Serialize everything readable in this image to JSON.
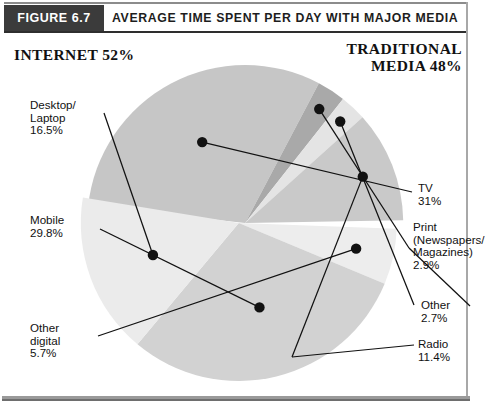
{
  "figure": {
    "tab_label": "FIGURE 6.7",
    "title": "AVERAGE TIME SPENT PER DAY WITH MAJOR MEDIA"
  },
  "sections": {
    "internet": "INTERNET 52%",
    "traditional_line1": "TRADITIONAL",
    "traditional_line2": "MEDIA 48%"
  },
  "labels": {
    "desktop": "Desktop/\nLaptop\n16.5%",
    "mobile": "Mobile\n29.8%",
    "other_digital": "Other\ndigital\n5.7%",
    "tv": "TV\n31%",
    "print": "Print\n(Newspapers/\nMagazines)\n2.9%",
    "other": "Other\n2.7%",
    "radio": "Radio\n11.4%"
  },
  "chart_data": {
    "type": "pie",
    "title": "AVERAGE TIME SPENT PER DAY WITH MAJOR MEDIA",
    "unit": "percent",
    "groups": [
      {
        "name": "INTERNET",
        "total": 52
      },
      {
        "name": "TRADITIONAL MEDIA",
        "total": 48
      }
    ],
    "categories": [
      "TV",
      "Print (Newspapers/Magazines)",
      "Other",
      "Radio",
      "Other digital",
      "Mobile",
      "Desktop/Laptop"
    ],
    "values": [
      31,
      2.9,
      2.7,
      11.4,
      5.7,
      29.8,
      16.5
    ],
    "slices": [
      {
        "label": "TV",
        "value": 31,
        "group": "TRADITIONAL MEDIA",
        "color": "#c6c6c6"
      },
      {
        "label": "Print (Newspapers/Magazines)",
        "value": 2.9,
        "group": "TRADITIONAL MEDIA",
        "color": "#a9a9a9"
      },
      {
        "label": "Other",
        "value": 2.7,
        "group": "TRADITIONAL MEDIA",
        "color": "#e4e4e4"
      },
      {
        "label": "Radio",
        "value": 11.4,
        "group": "TRADITIONAL MEDIA",
        "color": "#c9c9c9"
      },
      {
        "label": "Other digital",
        "value": 5.7,
        "group": "INTERNET",
        "color": "#ededed"
      },
      {
        "label": "Mobile",
        "value": 29.8,
        "group": "INTERNET",
        "color": "#d2d2d2"
      },
      {
        "label": "Desktop/Laptop",
        "value": 16.5,
        "group": "INTERNET",
        "color": "#ebebeb"
      }
    ],
    "legend": "none",
    "grid": false
  }
}
